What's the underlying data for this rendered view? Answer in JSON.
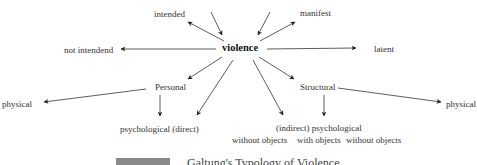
{
  "diagram": {
    "center": "violence",
    "top_left": "intended",
    "top_right": "manifest",
    "left": "not intendend",
    "right": "latent",
    "branch_personal": {
      "label": "Personal",
      "physical": "physical",
      "psychological": "psychological (direct)"
    },
    "branch_structural": {
      "label": "Structural",
      "physical": "physical",
      "psychological": "(indirect) psychological",
      "sub": [
        "without objects",
        "with objects",
        "without objects"
      ]
    }
  },
  "caption": {
    "label_box": "",
    "text": "Galtung's Typology of Violence"
  },
  "colors": {
    "arrow": "#222222",
    "caption_box": "#8a8a8a"
  }
}
